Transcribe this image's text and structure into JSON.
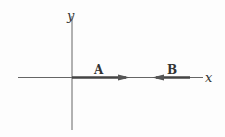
{
  "diagram": {
    "axes": {
      "x_label": "x",
      "y_label": "y"
    },
    "vectors": [
      {
        "label": "A",
        "direction": "+x",
        "from_x": 72,
        "to_x": 130
      },
      {
        "label": "B",
        "direction": "-x",
        "from_x": 190,
        "to_x": 152
      }
    ],
    "colors": {
      "axis": "#555555",
      "vector": "#444444",
      "background": "#fdfdfd"
    }
  }
}
